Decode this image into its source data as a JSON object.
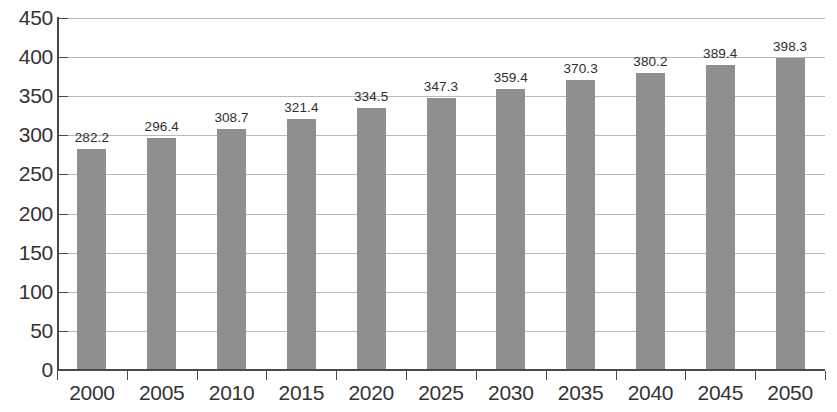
{
  "chart_data": {
    "type": "bar",
    "title": "",
    "subtitle": "",
    "xlabel": "",
    "ylabel": "",
    "categories": [
      "2000",
      "2005",
      "2010",
      "2015",
      "2020",
      "2025",
      "2030",
      "2035",
      "2040",
      "2045",
      "2050"
    ],
    "values": [
      282.2,
      296.4,
      308.7,
      321.4,
      334.5,
      347.3,
      359.4,
      370.3,
      380.2,
      389.4,
      398.3
    ],
    "value_labels": [
      "282.2",
      "296.4",
      "308.7",
      "321.4",
      "334.5",
      "347.3",
      "359.4",
      "370.3",
      "380.2",
      "389.4",
      "398.3"
    ],
    "ylim": [
      0,
      450
    ],
    "ytick_values": [
      0,
      50,
      100,
      150,
      200,
      250,
      300,
      350,
      400,
      450
    ],
    "ytick_labels": [
      "0",
      "50",
      "100",
      "150",
      "200",
      "250",
      "300",
      "350",
      "400",
      "450"
    ],
    "grid": true,
    "grid_axis": "y",
    "legend": false,
    "legend_position": "none",
    "series": [
      {
        "name": "",
        "values": [
          282.2,
          296.4,
          308.7,
          321.4,
          334.5,
          347.3,
          359.4,
          370.3,
          380.2,
          389.4,
          398.3
        ],
        "color": "#8f8f8f"
      }
    ],
    "colors": {
      "bar": "#8f8f8f",
      "gridline": "#b9b9b9",
      "axis": "#4a4a4a",
      "tick_label": "#333333",
      "value_label": "#2e2e2e",
      "background": "#ffffff"
    }
  }
}
